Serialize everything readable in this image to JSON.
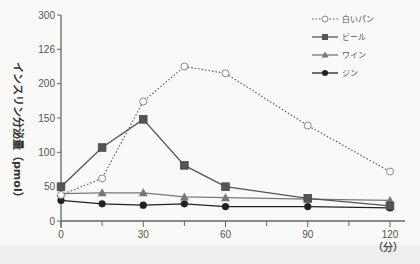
{
  "chart_data": {
    "type": "line",
    "title": "",
    "xlabel": "（分）",
    "ylabel": "インスリン分泌量（pmol）",
    "x": [
      0,
      15,
      30,
      45,
      60,
      90,
      120
    ],
    "x_tick_labels": [
      "0",
      "30",
      "60",
      "90",
      "120"
    ],
    "x_tick_values": [
      0,
      30,
      60,
      90,
      120
    ],
    "minor_x_ticks": [
      15,
      45,
      75,
      105
    ],
    "y_tick_labels": [
      "0",
      "50",
      "100",
      "150",
      "200",
      "126",
      "300"
    ],
    "y_tick_values": [
      0,
      50,
      100,
      150,
      200,
      250,
      300
    ],
    "ylim": [
      0,
      300
    ],
    "xlim": [
      0,
      120
    ],
    "grid": false,
    "legend_position": "top-right",
    "series": [
      {
        "name": "白いパン",
        "marker": "open-circle",
        "line": "dotted",
        "color": "#555555",
        "values": [
          38,
          62,
          174,
          225,
          215,
          139,
          72
        ]
      },
      {
        "name": "ビール",
        "marker": "square",
        "line": "solid",
        "color": "#555555",
        "values": [
          50,
          107,
          148,
          81,
          50,
          33,
          22
        ]
      },
      {
        "name": "ワイン",
        "marker": "triangle",
        "line": "solid",
        "color": "#777777",
        "values": [
          40,
          41,
          41,
          35,
          34,
          32,
          30
        ]
      },
      {
        "name": "ジン",
        "marker": "filled-circle",
        "line": "solid",
        "color": "#222222",
        "values": [
          30,
          25,
          23,
          25,
          21,
          21,
          19
        ]
      }
    ]
  },
  "legend": {
    "items": [
      "白いパン",
      "ビール",
      "ワイン",
      "ジン"
    ]
  },
  "axis": {
    "ylabel": "インスリン分泌量（pmol）",
    "xunit": "（分）"
  }
}
